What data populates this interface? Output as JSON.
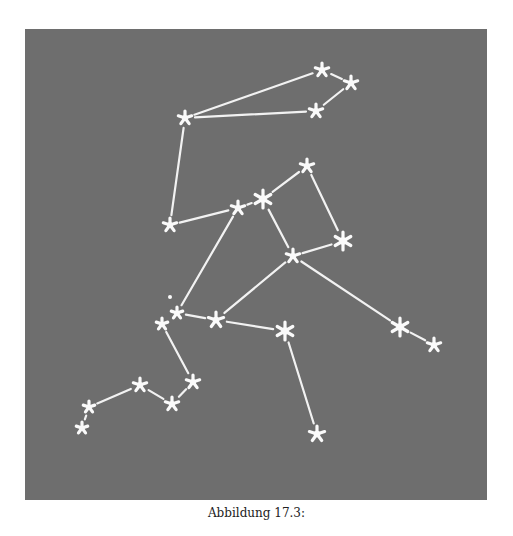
{
  "figure": {
    "background": "#6e6e6e",
    "line_color": "#f2f2f2",
    "star_color": "#fafafa",
    "stars": [
      {
        "id": "s1",
        "x": 322,
        "y": 70,
        "r": 7
      },
      {
        "id": "s2",
        "x": 351,
        "y": 83,
        "r": 7
      },
      {
        "id": "s3",
        "x": 316,
        "y": 111,
        "r": 7
      },
      {
        "id": "s4",
        "x": 185,
        "y": 118,
        "r": 7
      },
      {
        "id": "s5",
        "x": 170,
        "y": 225,
        "r": 7
      },
      {
        "id": "s6",
        "x": 238,
        "y": 208,
        "r": 7
      },
      {
        "id": "s7",
        "x": 263,
        "y": 199,
        "r": 9
      },
      {
        "id": "s8",
        "x": 307,
        "y": 166,
        "r": 7
      },
      {
        "id": "s9",
        "x": 293,
        "y": 256,
        "r": 7
      },
      {
        "id": "s10",
        "x": 343,
        "y": 241,
        "r": 9
      },
      {
        "id": "s11",
        "x": 177,
        "y": 313,
        "r": 6
      },
      {
        "id": "s12",
        "x": 162,
        "y": 324,
        "r": 6
      },
      {
        "id": "s13",
        "x": 216,
        "y": 320,
        "r": 8
      },
      {
        "id": "s14",
        "x": 285,
        "y": 331,
        "r": 9
      },
      {
        "id": "s15",
        "x": 400,
        "y": 327,
        "r": 9
      },
      {
        "id": "s16",
        "x": 434,
        "y": 345,
        "r": 7
      },
      {
        "id": "s17",
        "x": 317,
        "y": 434,
        "r": 8
      },
      {
        "id": "s18",
        "x": 193,
        "y": 382,
        "r": 7
      },
      {
        "id": "s19",
        "x": 172,
        "y": 404,
        "r": 7
      },
      {
        "id": "s20",
        "x": 140,
        "y": 385,
        "r": 7
      },
      {
        "id": "s21",
        "x": 89,
        "y": 407,
        "r": 6
      },
      {
        "id": "s22",
        "x": 82,
        "y": 428,
        "r": 6
      }
    ],
    "dots": [
      {
        "x": 170,
        "y": 297,
        "r": 2
      }
    ],
    "lines": [
      [
        "s1",
        "s2"
      ],
      [
        "s2",
        "s3"
      ],
      [
        "s1",
        "s4"
      ],
      [
        "s4",
        "s3"
      ],
      [
        "s4",
        "s5"
      ],
      [
        "s5",
        "s6"
      ],
      [
        "s6",
        "s7"
      ],
      [
        "s7",
        "s8"
      ],
      [
        "s8",
        "s10"
      ],
      [
        "s7",
        "s9"
      ],
      [
        "s9",
        "s10"
      ],
      [
        "s6",
        "s11"
      ],
      [
        "s9",
        "s13"
      ],
      [
        "s9",
        "s15"
      ],
      [
        "s15",
        "s16"
      ],
      [
        "s11",
        "s13"
      ],
      [
        "s13",
        "s14"
      ],
      [
        "s14",
        "s17"
      ],
      [
        "s12",
        "s18"
      ],
      [
        "s18",
        "s19"
      ],
      [
        "s19",
        "s20"
      ],
      [
        "s20",
        "s21"
      ],
      [
        "s21",
        "s22"
      ]
    ]
  },
  "caption": "Abbildung 17.3:"
}
